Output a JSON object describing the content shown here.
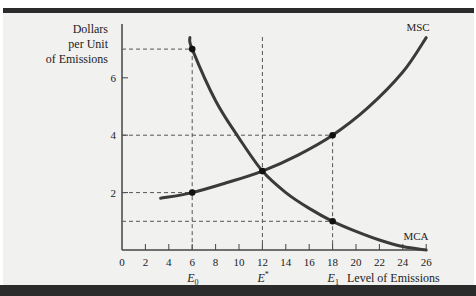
{
  "chart_data": {
    "type": "line",
    "title": "",
    "xlabel": "Level of Emissions",
    "ylabel": "Dollars per Unit of Emissions",
    "ylabel_lines": [
      "Dollars",
      "per Unit",
      "of Emissions"
    ],
    "xlim": [
      0,
      26
    ],
    "ylim": [
      0,
      7.5
    ],
    "x_ticks": [
      0,
      2,
      4,
      6,
      8,
      10,
      12,
      14,
      16,
      18,
      20,
      22,
      24,
      26
    ],
    "y_ticks": [
      2,
      4,
      6
    ],
    "grid": false,
    "series": [
      {
        "name": "MSC",
        "points": [
          [
            3.3,
            1.8
          ],
          [
            6,
            2
          ],
          [
            9,
            2.35
          ],
          [
            12,
            2.75
          ],
          [
            15,
            3.3
          ],
          [
            18,
            4
          ],
          [
            21,
            4.95
          ],
          [
            24,
            6.2
          ],
          [
            26.0,
            7.4
          ]
        ]
      },
      {
        "name": "MCA",
        "points": [
          [
            5.8,
            7.4
          ],
          [
            6,
            7
          ],
          [
            8,
            5.2
          ],
          [
            10,
            3.9
          ],
          [
            12,
            2.75
          ],
          [
            14,
            2.0
          ],
          [
            16,
            1.45
          ],
          [
            18,
            1
          ],
          [
            20,
            0.65
          ],
          [
            22,
            0.35
          ],
          [
            24,
            0.12
          ],
          [
            26,
            0
          ]
        ]
      }
    ],
    "marked_points": [
      {
        "x": 6,
        "y": 7,
        "curve": "MCA"
      },
      {
        "x": 6,
        "y": 2,
        "curve": "MSC"
      },
      {
        "x": 12,
        "y": 2.75,
        "curve": "intersection"
      },
      {
        "x": 18,
        "y": 4,
        "curve": "MSC"
      },
      {
        "x": 18,
        "y": 1,
        "curve": "MCA"
      }
    ],
    "annotations": [
      {
        "text": "E0",
        "x": 6
      },
      {
        "text": "E*",
        "x": 12
      },
      {
        "text": "E1",
        "x": 18
      },
      {
        "text": "MSC",
        "position": "top-right of MSC curve"
      },
      {
        "text": "MCA",
        "position": "right end of MCA curve"
      }
    ]
  },
  "labels": {
    "y_axis": [
      "Dollars",
      "per Unit",
      "of Emissions"
    ],
    "x_axis": "Level of Emissions",
    "msc": "MSC",
    "mca": "MCA",
    "e0_main": "E",
    "e0_sub": "0",
    "estar_main": "E",
    "estar_sup": "*",
    "e1_main": "E",
    "e1_sub": "1"
  }
}
